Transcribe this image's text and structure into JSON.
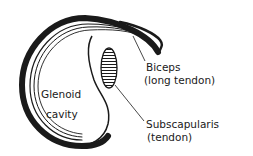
{
  "labels": {
    "glenoid_line1": "Glenoid",
    "glenoid_line2": "cavity",
    "biceps_line1": "Biceps",
    "biceps_line2": "(long tendon)",
    "subscap_line1": "Subscapularis",
    "subscap_line2": "(tendon)"
  },
  "colors": {
    "ink": "#1a1a1a",
    "background": "#ffffff"
  }
}
